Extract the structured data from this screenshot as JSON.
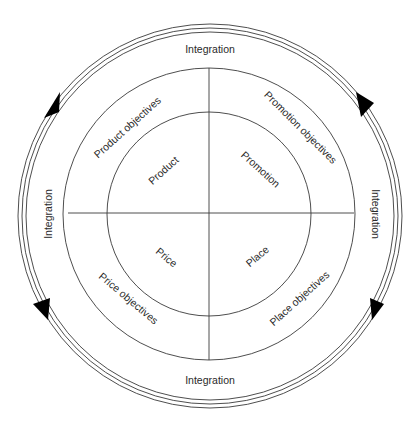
{
  "diagram": {
    "center": {
      "x": 209,
      "y": 214
    },
    "radii": {
      "inner": 102,
      "middle": 146,
      "outer": [
        183,
        187,
        192
      ]
    },
    "colors": {
      "line": "#3a3a3a",
      "arrow": "#000000",
      "text": "#2a2a2a",
      "background": "#ffffff"
    },
    "integration_labels": {
      "top": "Integration",
      "right": "Integration",
      "bottom": "Integration",
      "left": "Integration"
    },
    "quadrants": [
      {
        "id": "product",
        "position": "top-left",
        "inner_label": "Product",
        "outer_label": "Product objectives"
      },
      {
        "id": "promotion",
        "position": "top-right",
        "inner_label": "Promotion",
        "outer_label": "Promotion objectives"
      },
      {
        "id": "price",
        "position": "bottom-left",
        "inner_label": "Price",
        "outer_label": "Price objectives"
      },
      {
        "id": "place",
        "position": "bottom-right",
        "inner_label": "Place",
        "outer_label": "Place objectives"
      }
    ],
    "arrows": [
      {
        "position": "top-left",
        "direction": "up"
      },
      {
        "position": "top-right",
        "direction": "down"
      },
      {
        "position": "bottom-right",
        "direction": "down"
      },
      {
        "position": "bottom-left",
        "direction": "down"
      }
    ]
  }
}
